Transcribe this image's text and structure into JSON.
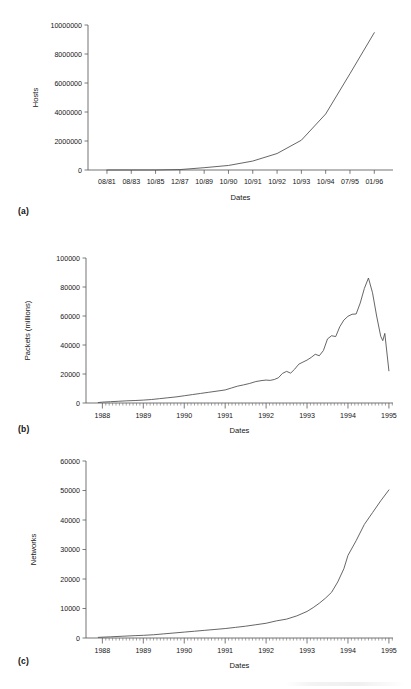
{
  "figure": {
    "panels": [
      {
        "id": "a",
        "panel_label": "(a)",
        "xlabel": "Dates",
        "ylabel": "Hosts"
      },
      {
        "id": "b",
        "panel_label": "(b)",
        "xlabel": "Dates",
        "ylabel": "Packets (millions)"
      },
      {
        "id": "c",
        "panel_label": "(c)",
        "xlabel": "Dates",
        "ylabel": "Networks"
      }
    ]
  },
  "chart_data": [
    {
      "type": "line",
      "panel": "a",
      "title": "",
      "xlabel": "Dates",
      "ylabel": "Hosts",
      "grid": false,
      "legend": "none",
      "ylim": [
        0,
        10000000
      ],
      "yticks": [
        0,
        2000000,
        4000000,
        6000000,
        8000000,
        10000000
      ],
      "ytick_labels": [
        "0",
        "2000000",
        "4000000",
        "6000000",
        "8000000",
        "10000000"
      ],
      "xtick_labels": [
        "08/81",
        "08/83",
        "10/85",
        "12/87",
        "10/89",
        "10/90",
        "10/91",
        "10/92",
        "10/93",
        "10/94",
        "07/95",
        "01/96"
      ],
      "x": [
        "08/81",
        "08/83",
        "10/85",
        "12/87",
        "10/89",
        "10/90",
        "10/91",
        "10/92",
        "10/93",
        "10/94",
        "07/95",
        "01/96"
      ],
      "values": [
        213,
        562,
        2308,
        28174,
        159000,
        313000,
        617000,
        1136000,
        2056000,
        3864000,
        6642000,
        9472000
      ]
    },
    {
      "type": "line",
      "panel": "b",
      "title": "",
      "xlabel": "Dates",
      "ylabel": "Packets (millions)",
      "grid": false,
      "legend": "none",
      "ylim": [
        0,
        100000
      ],
      "yticks": [
        0,
        20000,
        40000,
        60000,
        80000,
        100000
      ],
      "ytick_labels": [
        "0",
        "20000",
        "40000",
        "60000",
        "80000",
        "100000"
      ],
      "xtick_labels": [
        "1988",
        "1989",
        "1990",
        "1991",
        "1992",
        "1993",
        "1994",
        "1995"
      ],
      "xlim": [
        1987.6,
        1995.1
      ],
      "minor_ticks": "monthly",
      "x": [
        1987.9,
        1988.0,
        1988.2,
        1988.4,
        1988.6,
        1988.8,
        1989.0,
        1989.2,
        1989.4,
        1989.6,
        1989.8,
        1990.0,
        1990.2,
        1990.4,
        1990.6,
        1990.8,
        1991.0,
        1991.15,
        1991.3,
        1991.45,
        1991.6,
        1991.75,
        1991.9,
        1992.0,
        1992.1,
        1992.2,
        1992.3,
        1992.4,
        1992.5,
        1992.6,
        1992.7,
        1992.8,
        1992.9,
        1993.0,
        1993.1,
        1993.2,
        1993.3,
        1993.4,
        1993.5,
        1993.6,
        1993.7,
        1993.8,
        1993.9,
        1994.0,
        1994.1,
        1994.2,
        1994.3,
        1994.4,
        1994.5,
        1994.6,
        1994.7,
        1994.8,
        1994.85,
        1994.9,
        1995.0
      ],
      "values": [
        300,
        600,
        900,
        1200,
        1500,
        1700,
        2000,
        2400,
        3000,
        3600,
        4200,
        5000,
        5800,
        6600,
        7400,
        8200,
        9000,
        10300,
        11600,
        12500,
        13500,
        14800,
        15500,
        15800,
        15600,
        16200,
        17400,
        20400,
        21800,
        20600,
        23400,
        26800,
        28200,
        29600,
        31400,
        33600,
        32600,
        36200,
        44200,
        46400,
        45800,
        52600,
        57200,
        59800,
        61200,
        61400,
        69000,
        79000,
        86200,
        76000,
        60000,
        46000,
        43000,
        48000,
        22200
      ]
    },
    {
      "type": "line",
      "panel": "c",
      "title": "",
      "xlabel": "Dates",
      "ylabel": "Networks",
      "grid": false,
      "legend": "none",
      "ylim": [
        0,
        60000
      ],
      "yticks": [
        0,
        10000,
        20000,
        30000,
        40000,
        50000,
        60000
      ],
      "ytick_labels": [
        "0",
        "10000",
        "20000",
        "30000",
        "40000",
        "50000",
        "60000"
      ],
      "xtick_labels": [
        "1988",
        "1989",
        "1990",
        "1991",
        "1992",
        "1993",
        "1994",
        "1995"
      ],
      "xlim": [
        1987.6,
        1995.1
      ],
      "minor_ticks": "monthly",
      "x": [
        1987.9,
        1988.2,
        1988.5,
        1988.8,
        1989.0,
        1989.25,
        1989.5,
        1989.75,
        1990.0,
        1990.25,
        1990.5,
        1990.75,
        1991.0,
        1991.25,
        1991.5,
        1991.75,
        1992.0,
        1992.25,
        1992.5,
        1992.75,
        1993.0,
        1993.15,
        1993.3,
        1993.45,
        1993.6,
        1993.75,
        1993.9,
        1994.0,
        1994.2,
        1994.4,
        1994.6,
        1994.8,
        1995.0
      ],
      "values": [
        220,
        400,
        600,
        800,
        900,
        1100,
        1400,
        1700,
        2000,
        2300,
        2600,
        2900,
        3200,
        3600,
        4000,
        4500,
        5000,
        5800,
        6400,
        7500,
        9000,
        10300,
        11800,
        13500,
        15500,
        19000,
        23500,
        28000,
        33000,
        38500,
        42500,
        46500,
        50200
      ]
    }
  ]
}
